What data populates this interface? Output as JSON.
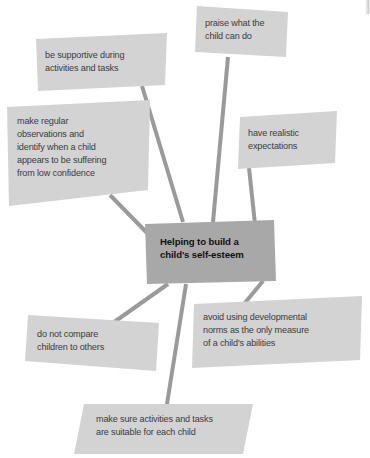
{
  "diagram": {
    "type": "mind-map",
    "background_color": "#ffffff",
    "node_fill": "#d3d3d3",
    "center_fill": "#a8a8a8",
    "connector_color": "#9a9a9a",
    "node_text_color": "#3c3c3c",
    "center_text_color": "#111111",
    "center": {
      "id": "center",
      "label_lines": [
        "Helping to build a",
        "child's self-esteem"
      ],
      "label": "Helping to build a child's self-esteem",
      "shape": "parallelogram",
      "points": "145,224 274,220 276,281 147,284",
      "text_x": 160,
      "text_y": 245,
      "line_height": 13
    },
    "branches": [
      {
        "id": "praise",
        "label_lines": [
          "praise what the",
          "child can do"
        ],
        "label": "praise what the child can do",
        "points": "197,6 288,12 286,57 195,52",
        "text_x": 205,
        "text_y": 26,
        "line_height": 13,
        "connector": "228,57 213,222"
      },
      {
        "id": "be-supportive",
        "label_lines": [
          "be supportive during",
          "activities and tasks"
        ],
        "label": "be supportive during activities and tasks",
        "points": "36,39 167,33 165,85 38,91",
        "text_x": 45,
        "text_y": 58,
        "line_height": 13,
        "connector": "142,86 183,222"
      },
      {
        "id": "make-regular-observations",
        "label_lines": [
          "make regular",
          "observations and",
          "identify when a child",
          "appears to be suffering",
          "from low confidence"
        ],
        "label": "make regular observations and identify when a child appears to be suffering from low confidence",
        "points": "7,107 150,100 148,190 9,206",
        "text_x": 17,
        "text_y": 124,
        "line_height": 13,
        "connector": "110,195 150,236"
      },
      {
        "id": "have-realistic-expectations",
        "label_lines": [
          "have realistic",
          "expectations"
        ],
        "label": "have realistic expectations",
        "points": "240,117 337,111 335,163 238,169",
        "text_x": 248,
        "text_y": 136,
        "line_height": 13,
        "connector": "249,168 255,224"
      },
      {
        "id": "avoid-using-norms",
        "label_lines": [
          "avoid using developmental",
          "norms as the only measure",
          "of a child's abilities"
        ],
        "label": "avoid using developmental norms as the only measure of a child's abilities",
        "points": "194,304 362,296 360,360 192,368",
        "text_x": 203,
        "text_y": 320,
        "line_height": 13,
        "connector": "244,304 263,281"
      },
      {
        "id": "do-not-compare",
        "label_lines": [
          "do not compare",
          "children to others"
        ],
        "label": "do not compare children to others",
        "points": "28,315 159,323 156,371 25,361",
        "text_x": 37,
        "text_y": 337,
        "line_height": 13,
        "connector": "110,325 168,284"
      },
      {
        "id": "suitable-activities",
        "label_lines": [
          "make sure activities and tasks",
          "are suitable for each child"
        ],
        "label": "make sure activities and tasks are suitable for each child",
        "points": "84,404 253,404 243,454 74,454",
        "text_x": 96,
        "text_y": 422,
        "line_height": 13,
        "connector": "167,404 186,284"
      }
    ]
  }
}
